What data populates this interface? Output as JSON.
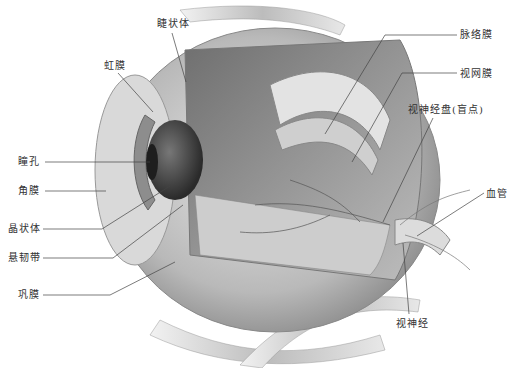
{
  "diagram": {
    "labels": [
      {
        "id": "ciliary-body",
        "text": "睫状体",
        "x": 157,
        "y": 18
      },
      {
        "id": "iris",
        "text": "虹膜",
        "x": 104,
        "y": 60
      },
      {
        "id": "pupil",
        "text": "瞳孔",
        "x": 18,
        "y": 156
      },
      {
        "id": "cornea",
        "text": "角膜",
        "x": 18,
        "y": 185
      },
      {
        "id": "lens",
        "text": "晶状体",
        "x": 8,
        "y": 223
      },
      {
        "id": "zonule",
        "text": "悬韧带",
        "x": 8,
        "y": 252
      },
      {
        "id": "sclera",
        "text": "巩膜",
        "x": 18,
        "y": 289
      },
      {
        "id": "choroid",
        "text": "脉络膜",
        "x": 460,
        "y": 29
      },
      {
        "id": "retina",
        "text": "视网膜",
        "x": 460,
        "y": 68
      },
      {
        "id": "optic-disc",
        "text": "视神经盘(盲点)",
        "x": 408,
        "y": 104
      },
      {
        "id": "blood-vessel",
        "text": "血管",
        "x": 486,
        "y": 188
      },
      {
        "id": "optic-nerve",
        "text": "视神经",
        "x": 396,
        "y": 318
      }
    ]
  }
}
